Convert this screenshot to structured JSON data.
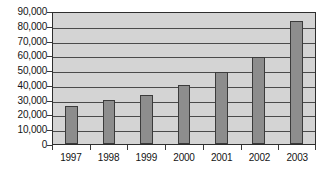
{
  "chart_data": {
    "type": "bar",
    "title": "",
    "subtitle": "",
    "xlabel": "",
    "ylabel": "",
    "categories": [
      "1997",
      "1998",
      "1999",
      "2000",
      "2001",
      "2002",
      "2003"
    ],
    "values": [
      25700,
      29800,
      33200,
      40000,
      48700,
      58900,
      83300
    ],
    "series": [
      {
        "name": "",
        "values": [
          25700,
          29800,
          33200,
          40000,
          48700,
          58900,
          83300
        ]
      }
    ],
    "ylim": [
      0,
      90000
    ],
    "yticks": [
      0,
      10000,
      20000,
      30000,
      40000,
      50000,
      60000,
      70000,
      80000,
      90000
    ],
    "ytick_labels": [
      "0",
      "10,000",
      "20,000",
      "30,000",
      "40,000",
      "50,000",
      "60,000",
      "70,000",
      "80,000",
      "90,000"
    ],
    "xtick_labels": [
      "1997",
      "1998",
      "1999",
      "2000",
      "2001",
      "2002",
      "2003"
    ],
    "grid": true,
    "grid_axis": "y",
    "legend": false,
    "legend_position": "none",
    "annotations": [],
    "colors": {
      "bar_fill": "#8d8d8d",
      "bar_border": "#3b3b3b",
      "plot_background": "#d4d4d4",
      "gridline": "#4a4a4a",
      "axis": "#2e2e2e",
      "text": "#141414",
      "page_background": "#ffffff"
    }
  }
}
